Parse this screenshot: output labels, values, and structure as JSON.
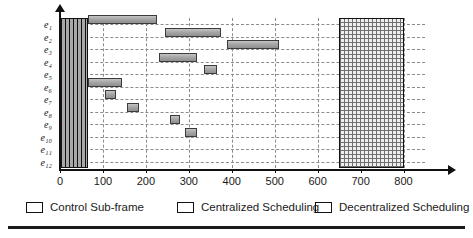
{
  "chart_data": {
    "type": "bar",
    "subtype": "gantt-schedule",
    "title": "",
    "xlabel": "",
    "ylabel": "",
    "xlim": [
      0,
      850
    ],
    "xticks": [
      0,
      100,
      200,
      300,
      400,
      500,
      600,
      700,
      800
    ],
    "xtick_labels": [
      "0",
      "100",
      "200",
      "300",
      "400",
      "500",
      "600",
      "700",
      "800"
    ],
    "categories": [
      "e1",
      "e2",
      "e3",
      "e4",
      "e5",
      "e6",
      "e7",
      "e8",
      "e9",
      "e10",
      "e11",
      "e12"
    ],
    "ytick_labels": [
      "e₁",
      "e₂",
      "e₃",
      "e₄",
      "e₅",
      "e₆",
      "e₇",
      "e₈",
      "e₉",
      "e₁₀",
      "e₁₁",
      "e₁₂"
    ],
    "grid": "dashed-both",
    "legend_position": "bottom",
    "colors": {
      "control": "#111111",
      "centralized": "#a6a6a6",
      "decentralized": "#6f6f6f",
      "grid": "#8c8c8c",
      "axis": "#111111",
      "background": "#ffffff"
    },
    "regions": [
      {
        "name": "Control Sub-frame",
        "kind": "control",
        "start": 0,
        "end": 65,
        "spans_all_rows": true
      },
      {
        "name": "Decentralized Scheduling",
        "kind": "decentralized",
        "start": 650,
        "end": 800,
        "spans_all_rows": true
      }
    ],
    "series": [
      {
        "name": "Centralized Scheduling",
        "kind": "centralized",
        "bars": [
          {
            "row": "e1",
            "start": 65,
            "end": 225
          },
          {
            "row": "e2",
            "start": 245,
            "end": 375
          },
          {
            "row": "e3",
            "start": 390,
            "end": 510
          },
          {
            "row": "e4",
            "start": 230,
            "end": 320
          },
          {
            "row": "e5",
            "start": 335,
            "end": 365
          },
          {
            "row": "e6",
            "start": 65,
            "end": 145
          },
          {
            "row": "e7",
            "start": 105,
            "end": 130
          },
          {
            "row": "e8",
            "start": 155,
            "end": 185
          },
          {
            "row": "e9",
            "start": 255,
            "end": 280
          },
          {
            "row": "e10",
            "start": 290,
            "end": 320
          }
        ]
      }
    ],
    "legend": [
      {
        "label": "Control Sub-frame",
        "swatch": "control"
      },
      {
        "label": "Centralized Scheduling",
        "swatch": "centralized"
      },
      {
        "label": "Decentralized Scheduling",
        "swatch": "decentralized"
      }
    ]
  }
}
